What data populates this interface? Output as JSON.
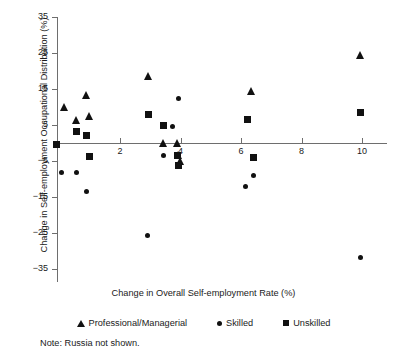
{
  "chart_data": {
    "type": "scatter",
    "title": "",
    "xlabel": "Change in Overall Self-employment Rate (%)",
    "ylabel": "Change in Self-employment Occupational Distribution (%)",
    "xlim": [
      -0.6,
      11.0
    ],
    "ylim": [
      -35,
      35
    ],
    "xticks": [
      2,
      4,
      6,
      8,
      10
    ],
    "yticks": [
      35,
      25,
      15,
      5,
      -5,
      -15,
      -25,
      -35
    ],
    "grid": false,
    "legend_position": "bottom",
    "note": "Note: Russia not shown.",
    "series": [
      {
        "name": "Professional/Managerial",
        "marker": "triangle",
        "color": "#111111",
        "points": [
          {
            "x": 0.15,
            "y": 10.0
          },
          {
            "x": 0.55,
            "y": 6.2
          },
          {
            "x": 0.9,
            "y": 13.3
          },
          {
            "x": 1.0,
            "y": 7.5
          },
          {
            "x": 2.95,
            "y": 18.5
          },
          {
            "x": 3.45,
            "y": 0.0
          },
          {
            "x": 3.9,
            "y": 0.0
          },
          {
            "x": 3.95,
            "y": -3.4
          },
          {
            "x": 4.0,
            "y": -5.0
          },
          {
            "x": 6.35,
            "y": 14.2
          },
          {
            "x": 9.95,
            "y": 24.2
          }
        ]
      },
      {
        "name": "Skilled",
        "marker": "circle",
        "color": "#111111",
        "points": [
          {
            "x": 0.05,
            "y": -8.3
          },
          {
            "x": 0.55,
            "y": -8.3
          },
          {
            "x": 0.9,
            "y": -13.6
          },
          {
            "x": 2.9,
            "y": -25.6
          },
          {
            "x": 3.45,
            "y": -3.6
          },
          {
            "x": 3.75,
            "y": 4.7
          },
          {
            "x": 3.95,
            "y": 12.3
          },
          {
            "x": 6.15,
            "y": -12.1
          },
          {
            "x": 6.4,
            "y": -9.0
          },
          {
            "x": 9.95,
            "y": -31.7
          }
        ]
      },
      {
        "name": "Unskilled",
        "marker": "square",
        "color": "#111111",
        "points": [
          {
            "x": -0.1,
            "y": -0.4
          },
          {
            "x": 0.55,
            "y": 3.3
          },
          {
            "x": 0.9,
            "y": 2.2
          },
          {
            "x": 1.0,
            "y": -3.8
          },
          {
            "x": 2.95,
            "y": 7.9
          },
          {
            "x": 3.45,
            "y": 5.0
          },
          {
            "x": 3.9,
            "y": -3.5
          },
          {
            "x": 3.95,
            "y": -6.2
          },
          {
            "x": 6.2,
            "y": 6.4
          },
          {
            "x": 6.4,
            "y": -4.0
          },
          {
            "x": 9.95,
            "y": 8.6
          }
        ]
      }
    ]
  },
  "legend": {
    "items": [
      {
        "label": "Professional/Managerial",
        "marker": "triangle"
      },
      {
        "label": "Skilled",
        "marker": "circle"
      },
      {
        "label": "Unskilled",
        "marker": "square"
      }
    ]
  },
  "note": {
    "text": "Note: Russia not shown."
  }
}
